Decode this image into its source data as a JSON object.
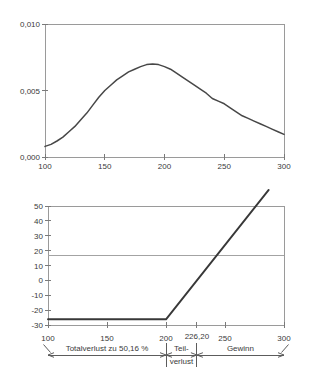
{
  "figure": {
    "background": "#ffffff",
    "colors": {
      "frame": "#9a9a9a",
      "tick": "#7a7a7a",
      "label_text": "#3a3a3a",
      "curve": "#474747",
      "payoff_line": "#383838",
      "reference_line": "#a3a3a3",
      "annotation": "#5c5c5c"
    }
  },
  "chart_data": [
    {
      "id": "density-chart",
      "type": "line",
      "title": "",
      "xlabel": "",
      "ylabel": "",
      "xlim": [
        100,
        300
      ],
      "ylim": [
        0,
        0.01
      ],
      "grid": false,
      "legend": "none",
      "x_ticks": [
        {
          "value": 100,
          "label": "100"
        },
        {
          "value": 150,
          "label": "150"
        },
        {
          "value": 200,
          "label": "200"
        },
        {
          "value": 250,
          "label": "250"
        },
        {
          "value": 300,
          "label": "300"
        }
      ],
      "y_ticks": [
        {
          "value": 0.0,
          "label": "0,000"
        },
        {
          "value": 0.005,
          "label": "0,005"
        },
        {
          "value": 0.01,
          "label": "0,010"
        }
      ],
      "series": [
        {
          "name": "density-curve",
          "points": [
            [
              100,
              0.0008
            ],
            [
              105,
              0.00095
            ],
            [
              110,
              0.0012
            ],
            [
              115,
              0.0015
            ],
            [
              120,
              0.0019
            ],
            [
              125,
              0.0023
            ],
            [
              130,
              0.0028
            ],
            [
              135,
              0.0033
            ],
            [
              140,
              0.0039
            ],
            [
              145,
              0.0045
            ],
            [
              150,
              0.005
            ],
            [
              155,
              0.0054
            ],
            [
              160,
              0.0058
            ],
            [
              165,
              0.0061
            ],
            [
              170,
              0.0064
            ],
            [
              175,
              0.0066
            ],
            [
              180,
              0.0068
            ],
            [
              185,
              0.00695
            ],
            [
              190,
              0.007
            ],
            [
              195,
              0.00695
            ],
            [
              200,
              0.0068
            ],
            [
              205,
              0.0066
            ],
            [
              210,
              0.0063
            ],
            [
              215,
              0.006
            ],
            [
              220,
              0.0057
            ],
            [
              225,
              0.0054
            ],
            [
              230,
              0.0051
            ],
            [
              235,
              0.0048
            ],
            [
              240,
              0.0044
            ],
            [
              245,
              0.0042
            ],
            [
              250,
              0.004
            ],
            [
              255,
              0.0037
            ],
            [
              260,
              0.0034
            ],
            [
              265,
              0.0031
            ],
            [
              270,
              0.0029
            ],
            [
              275,
              0.0027
            ],
            [
              280,
              0.0025
            ],
            [
              285,
              0.0023
            ],
            [
              290,
              0.0021
            ],
            [
              295,
              0.0019
            ],
            [
              300,
              0.0017
            ]
          ]
        }
      ]
    },
    {
      "id": "payoff-chart",
      "type": "line",
      "title": "",
      "xlabel": "",
      "ylabel": "",
      "xlim": [
        100,
        300
      ],
      "ylim": [
        -30,
        50
      ],
      "grid": false,
      "legend": "none",
      "break_even_label": "226,20",
      "x_ticks": [
        {
          "value": 100,
          "label": "100"
        },
        {
          "value": 150,
          "label": "150"
        },
        {
          "value": 200,
          "label": "200"
        },
        {
          "value": 226.2,
          "label": "226,20",
          "dy": -2
        },
        {
          "value": 250,
          "label": "250"
        },
        {
          "value": 300,
          "label": "300"
        }
      ],
      "y_ticks": [
        {
          "value": -30,
          "label": "-30"
        },
        {
          "value": -20,
          "label": "-20"
        },
        {
          "value": -10,
          "label": "-10"
        },
        {
          "value": 0,
          "label": "0"
        },
        {
          "value": 10,
          "label": "10"
        },
        {
          "value": 20,
          "label": "20"
        },
        {
          "value": 30,
          "label": "30"
        },
        {
          "value": 40,
          "label": "40"
        },
        {
          "value": 50,
          "label": "50"
        }
      ],
      "reference_lines": [
        {
          "y": 17
        }
      ],
      "series": [
        {
          "name": "payoff-line",
          "points": [
            [
              100,
              -26.2
            ],
            [
              200,
              -26.2
            ],
            [
              287,
              60.8
            ]
          ]
        }
      ],
      "annotations": [
        {
          "from": 100,
          "to": 200,
          "label_lines": [
            "Totalverlust zu 50,16 %"
          ]
        },
        {
          "from": 200,
          "to": 226.2,
          "label_lines": [
            "Teil-",
            "verlust"
          ]
        },
        {
          "from": 226.2,
          "to": 300,
          "label_lines": [
            "Gewinn"
          ]
        }
      ]
    }
  ]
}
